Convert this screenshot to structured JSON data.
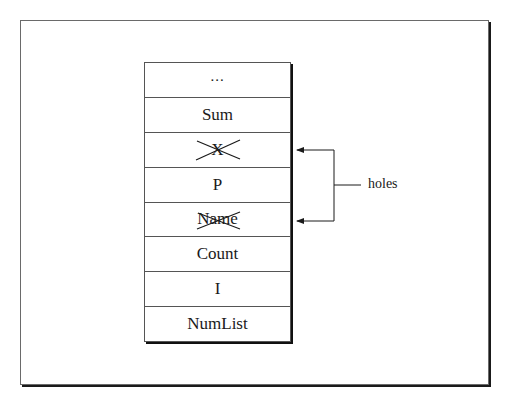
{
  "diagram": {
    "stack": {
      "cells": [
        {
          "label": "...",
          "crossed": false
        },
        {
          "label": "Sum",
          "crossed": false
        },
        {
          "label": "X",
          "crossed": true
        },
        {
          "label": "P",
          "crossed": false
        },
        {
          "label": "Name",
          "crossed": true
        },
        {
          "label": "Count",
          "crossed": false
        },
        {
          "label": "I",
          "crossed": false
        },
        {
          "label": "NumList",
          "crossed": false
        }
      ]
    },
    "annotation": {
      "label": "holes",
      "points_to": [
        "X",
        "Name"
      ]
    }
  }
}
